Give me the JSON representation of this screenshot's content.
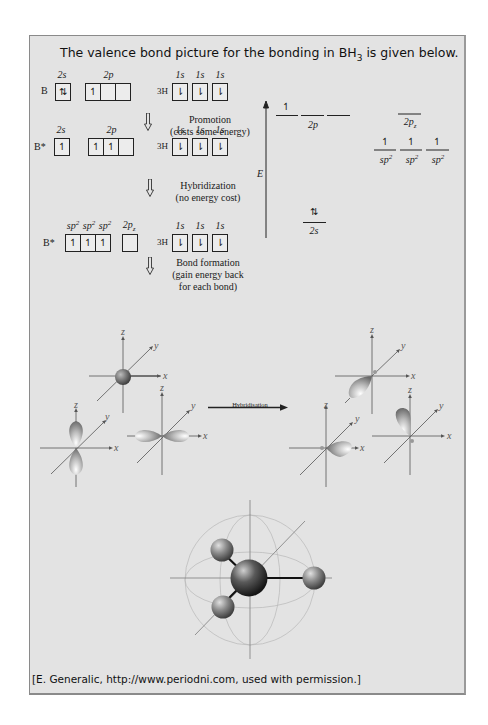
{
  "title": {
    "text_before": "The valence bond picture for the bonding in BH",
    "subscript": "3",
    "text_after": " is given below."
  },
  "configs": {
    "row1": {
      "atom": "B",
      "orbitals": [
        {
          "label": "2s",
          "boxes": [
            "⇅"
          ]
        },
        {
          "label": "2p",
          "boxes": [
            "↿",
            "",
            ""
          ]
        }
      ],
      "h_atom": "3H",
      "h_label": "1s",
      "h_boxes": [
        "⇂",
        "⇂",
        "⇂"
      ]
    },
    "row2": {
      "atom": "B*",
      "orbitals": [
        {
          "label": "2s",
          "boxes": [
            "↿"
          ]
        },
        {
          "label": "2p",
          "boxes": [
            "↿",
            "↿",
            ""
          ]
        }
      ],
      "h_atom": "3H",
      "h_label": "1s",
      "h_boxes": [
        "⇂",
        "⇂",
        "⇂"
      ]
    },
    "row3": {
      "atom": "B*",
      "orbitals": [
        {
          "label": "sp2 sp2 sp2",
          "boxes": [
            "↿",
            "↿",
            "↿"
          ]
        },
        {
          "label": "2pz",
          "boxes": [
            ""
          ]
        }
      ],
      "h_atom": "3H",
      "h_label": "1s",
      "h_boxes": [
        "⇂",
        "⇂",
        "⇂"
      ]
    }
  },
  "steps": {
    "promotion": {
      "line1": "Promotion",
      "line2": "(costs some energy)"
    },
    "hybridization": {
      "line1": "Hybridization",
      "line2": "(no energy cost)"
    },
    "bond_formation": {
      "line1": "Bond formation",
      "line2": "(gain energy back",
      "line3": "for each bond)"
    }
  },
  "energy_diagram": {
    "axis_label": "E",
    "levels_left": [
      {
        "label": "2p",
        "count": 3,
        "electrons": [
          "↿",
          "",
          ""
        ]
      },
      {
        "label": "2s",
        "count": 1,
        "electrons": [
          "⇅"
        ]
      }
    ],
    "levels_right": [
      {
        "label": "2pz",
        "count": 1,
        "electrons": [
          ""
        ]
      },
      {
        "label": "sp2",
        "count": 3,
        "electrons": [
          "↿",
          "↿",
          "↿"
        ]
      }
    ]
  },
  "orbital_figure": {
    "axis_labels": {
      "x": "x",
      "y": "y",
      "z": "z"
    },
    "arrow_label": "Hybridisation"
  },
  "caption": "[E. Generalic, http://www.periodni.com, used with permission.]"
}
